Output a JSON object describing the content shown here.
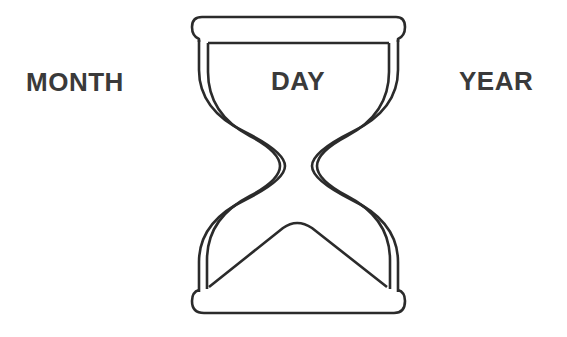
{
  "diagram": {
    "type": "hourglass-time-units",
    "labels": {
      "left": "MONTH",
      "center": "DAY",
      "right": "YEAR"
    },
    "icon": "hourglass-icon",
    "colors": {
      "stroke": "#2b2b2b",
      "text": "#3a3a3a",
      "background": "#ffffff"
    }
  }
}
